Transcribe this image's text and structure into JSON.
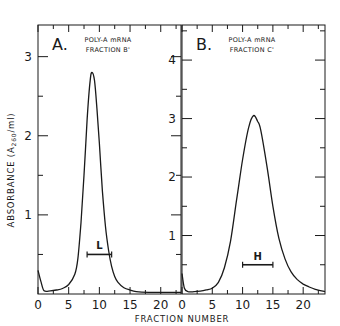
{
  "chart_data": [
    {
      "type": "line",
      "panel": "A.",
      "title_lines": [
        "POLY-A mRNA",
        "FRACTION B'"
      ],
      "xlabel": "FRACTION NUMBER",
      "ylabel": "ABSORBANCE (A260/ml)",
      "xlim": [
        0,
        23.3
      ],
      "ylim": [
        0,
        3.4
      ],
      "xticks": [
        0,
        5,
        10,
        15,
        20
      ],
      "xtick_labels": [
        "0",
        "5",
        "10",
        "15",
        "20"
      ],
      "yticks": [
        1,
        2,
        3
      ],
      "ytick_labels": [
        "1",
        "2",
        "3"
      ],
      "series": [
        {
          "name": "Fraction B'",
          "x": [
            0,
            0.5,
            1,
            2,
            3,
            4,
            5,
            6,
            6.5,
            7,
            7.5,
            8,
            8.5,
            8.8,
            9.2,
            9.6,
            10,
            10.5,
            11,
            11.5,
            12,
            12.5,
            13,
            14,
            15,
            16,
            18,
            20,
            23.3
          ],
          "y": [
            0.3,
            0.15,
            0.04,
            0.04,
            0.05,
            0.07,
            0.12,
            0.25,
            0.45,
            0.9,
            1.5,
            2.2,
            2.7,
            2.8,
            2.7,
            2.35,
            1.9,
            1.3,
            0.85,
            0.55,
            0.35,
            0.22,
            0.15,
            0.08,
            0.05,
            0.03,
            0.02,
            0.02,
            0.02
          ]
        }
      ],
      "annotation": {
        "label": "L",
        "x_range": [
          8,
          12
        ],
        "y": 0.5
      }
    },
    {
      "type": "line",
      "panel": "B.",
      "title_lines": [
        "POLY-A mRNA",
        "FRACTION C'"
      ],
      "xlabel": "FRACTION NUMBER",
      "xlim": [
        0,
        23.6
      ],
      "ylim": [
        0,
        4.6
      ],
      "xticks": [
        0,
        5,
        10,
        15,
        20
      ],
      "xtick_labels": [
        "0",
        "5",
        "10",
        "15",
        "20"
      ],
      "yticks": [
        1,
        2,
        3,
        4
      ],
      "ytick_labels": [
        "1",
        "2",
        "3",
        "4"
      ],
      "series": [
        {
          "name": "Fraction C'",
          "x": [
            0,
            0.4,
            1,
            2,
            3,
            4,
            5,
            6,
            7,
            8,
            9,
            10,
            11,
            11.8,
            12.5,
            13,
            14,
            15,
            16,
            17,
            18,
            19,
            20,
            21,
            22,
            23.6
          ],
          "y": [
            0.35,
            0.1,
            0.04,
            0.04,
            0.05,
            0.07,
            0.1,
            0.2,
            0.45,
            0.9,
            1.6,
            2.3,
            2.85,
            3.05,
            2.95,
            2.8,
            2.2,
            1.5,
            0.95,
            0.6,
            0.38,
            0.25,
            0.17,
            0.12,
            0.08,
            0.04
          ]
        }
      ],
      "annotation": {
        "label": "H",
        "x_range": [
          10,
          15
        ],
        "y": 0.5
      }
    }
  ],
  "labels": {
    "ylabel_prefix": "ABSORBANCE (A",
    "ylabel_sub": "260",
    "ylabel_suffix": "/ml)",
    "xlabel": "FRACTION NUMBER"
  }
}
